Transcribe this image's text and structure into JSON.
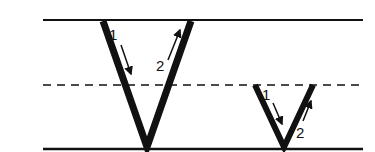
{
  "diagram": {
    "colors": {
      "ink": "#111111",
      "background": "#ffffff"
    },
    "guidelines": {
      "top": {
        "y": 20,
        "style": "solid"
      },
      "midline": {
        "y": 85,
        "style": "dashed"
      },
      "baseline": {
        "y": 149,
        "style": "solid"
      },
      "x_start": 43,
      "x_end": 363
    },
    "letters": [
      {
        "name": "uppercase-V",
        "strokes": [
          {
            "number": "1",
            "direction": "down-right"
          },
          {
            "number": "2",
            "direction": "up-right"
          }
        ]
      },
      {
        "name": "lowercase-v",
        "strokes": [
          {
            "number": "1",
            "direction": "down-right"
          },
          {
            "number": "2",
            "direction": "up-right"
          }
        ]
      }
    ]
  }
}
